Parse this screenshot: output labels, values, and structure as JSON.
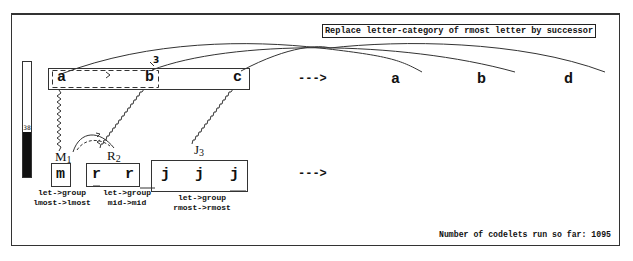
{
  "rule": {
    "text": "Replace letter-category of rmost letter by successor"
  },
  "temperature": {
    "value": "38",
    "fill_percent": 38
  },
  "initial_string": {
    "letters": [
      "a",
      "b",
      "c"
    ],
    "arrow": "--->",
    "bond_strength_label": "3"
  },
  "modified_string": {
    "letters": [
      "a",
      "b",
      "d"
    ]
  },
  "target_string": {
    "groups": [
      {
        "label": "M",
        "subscript": "1",
        "letters": [
          "m"
        ],
        "bond_line1": "let->group",
        "bond_line2": "lmost->lmost"
      },
      {
        "label": "R",
        "subscript": "2",
        "letters": [
          "r",
          "r"
        ],
        "bond_line1": "let->group",
        "bond_line2": "mid->mid"
      },
      {
        "label": "J",
        "subscript": "3",
        "letters": [
          "j",
          "j",
          "j"
        ],
        "bond_line1": "let->group",
        "bond_line2": "rmost->rmost"
      }
    ],
    "arrow": "--->"
  },
  "status": {
    "codelets_text": "Number of codelets run so far: 1095"
  }
}
